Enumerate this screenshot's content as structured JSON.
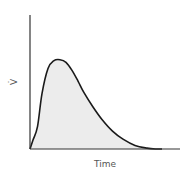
{
  "chart_data": {
    "type": "area",
    "title": "",
    "xlabel": "Time",
    "ylabel": "V̇",
    "x": [
      0,
      0.02,
      0.05,
      0.08,
      0.12,
      0.16,
      0.2,
      0.24,
      0.28,
      0.32,
      0.36,
      0.42,
      0.48,
      0.55,
      0.62,
      0.7,
      0.78,
      0.84,
      0.88
    ],
    "series": [
      {
        "name": "flow",
        "values": [
          0,
          0.1,
          0.25,
          0.62,
          0.9,
          0.99,
          1.0,
          0.97,
          0.88,
          0.76,
          0.63,
          0.47,
          0.33,
          0.2,
          0.11,
          0.04,
          0.01,
          0.0,
          0.0
        ]
      }
    ],
    "xlim": [
      0,
      1
    ],
    "ylim": [
      0,
      1.5
    ],
    "ticks": "none",
    "grid": false,
    "legend": "none",
    "colors": {
      "line": "#1a1a1a",
      "fill": "#ececec",
      "axis": "#333333"
    }
  }
}
